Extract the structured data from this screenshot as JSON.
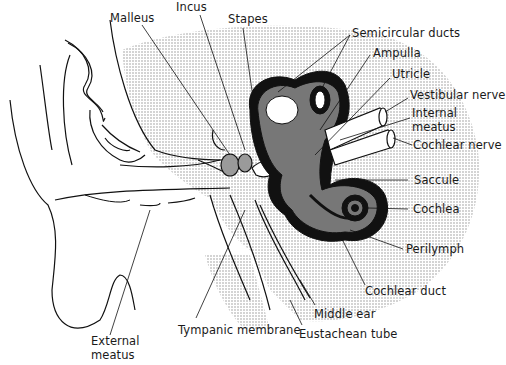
{
  "diagram": {
    "type": "anatomical-illustration",
    "colors": {
      "line": "#111111",
      "fill_gray": "#7a7a7a",
      "stipple": "#d8d8d8",
      "background": "#ffffff"
    },
    "labels": {
      "malleus": "Malleus",
      "incus": "Incus",
      "stapes": "Stapes",
      "semicircular_ducts": "Semicircular ducts",
      "ampulla": "Ampulla",
      "utricle": "Utricle",
      "vestibular_nerve": "Vestibular nerve",
      "internal_meatus_1": "Internal",
      "internal_meatus_2": "meatus",
      "cochlear_nerve": "Cochlear nerve",
      "saccule": "Saccule",
      "cochlea": "Cochlea",
      "perilymph": "Perilymph",
      "cochlear_duct": "Cochlear duct",
      "middle_ear": "Middle ear",
      "eustachean_tube": "Eustachean tube",
      "tympanic_membrane": "Tympanic membrane",
      "external_meatus_1": "External",
      "external_meatus_2": "meatus"
    }
  }
}
